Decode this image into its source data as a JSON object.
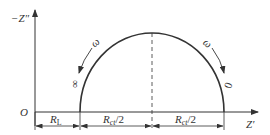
{
  "diagram": {
    "type": "nyquist-plot",
    "axes": {
      "y_label": "−Z″",
      "x_label": "Z′",
      "origin_label": "O"
    },
    "curve": {
      "shape": "semicircle",
      "low_freq_end_label": "∞",
      "high_freq_end_label": "0",
      "left_freq_label": "ω",
      "right_freq_label": "ω"
    },
    "dimensions": [
      {
        "label_main": "R",
        "label_sub": "L"
      },
      {
        "label_main": "R",
        "label_sub": "ct",
        "suffix": "/2"
      },
      {
        "label_main": "R",
        "label_sub": "ct",
        "suffix": "/2"
      }
    ],
    "colors": {
      "line": "#333333",
      "background": "#ffffff"
    }
  }
}
